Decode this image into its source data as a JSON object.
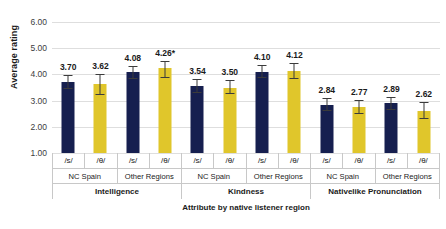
{
  "chart_data": {
    "type": "bar",
    "title": "",
    "xlabel": "Attribute by native listener region",
    "ylabel": "Average rating",
    "ylim": [
      1.0,
      6.0
    ],
    "ytick_labels": [
      "6.00",
      "5.00",
      "4.00",
      "3.00",
      "2.00",
      "1.00"
    ],
    "ytick_values": [
      6.0,
      5.0,
      4.0,
      3.0,
      2.0,
      1.0
    ],
    "grid": true,
    "legend_position": "none",
    "categories": [
      "Intelligence / NC Spain / /s/",
      "Intelligence / NC Spain / /θ/",
      "Intelligence / Other Regions / /s/",
      "Intelligence / Other Regions / /θ/",
      "Kindness / NC Spain / /s/",
      "Kindness / NC Spain / /θ/",
      "Kindness / Other Regions / /s/",
      "Kindness / Other Regions / /θ/",
      "Nativelike Pronunciation / NC Spain / /s/",
      "Nativelike Pronunciation / NC Spain / /θ/",
      "Nativelike Pronunciation / Other Regions / /s/",
      "Nativelike Pronunciation / Other Regions / /θ/"
    ],
    "values": [
      3.7,
      3.62,
      4.08,
      4.26,
      3.54,
      3.5,
      4.1,
      4.12,
      2.84,
      2.77,
      2.89,
      2.62
    ],
    "data_labels": [
      "3.70",
      "3.62",
      "4.08",
      "4.26*",
      "3.54",
      "3.50",
      "4.10",
      "4.12",
      "2.84",
      "2.77",
      "2.89",
      "2.62"
    ],
    "error_low": [
      3.46,
      3.21,
      3.84,
      3.86,
      3.28,
      3.24,
      3.86,
      3.83,
      2.6,
      2.5,
      2.63,
      2.3
    ],
    "error_high": [
      3.96,
      4.0,
      4.33,
      4.52,
      3.83,
      3.78,
      4.35,
      4.42,
      3.1,
      3.02,
      3.15,
      2.95
    ],
    "annotations": [
      "* indicates significant difference"
    ],
    "series_colors": {
      "s_phoneme": "#161f4f",
      "theta_phoneme": "#e0c62b"
    },
    "bars": [
      {
        "group": "Intelligence",
        "region": "NC Spain",
        "phoneme": "/s/",
        "value": 3.7,
        "label": "3.70",
        "low": 3.46,
        "high": 3.96,
        "color": "navy"
      },
      {
        "group": "Intelligence",
        "region": "NC Spain",
        "phoneme": "/θ/",
        "value": 3.62,
        "label": "3.62",
        "low": 3.21,
        "high": 4.0,
        "color": "gold"
      },
      {
        "group": "Intelligence",
        "region": "Other Regions",
        "phoneme": "/s/",
        "value": 4.08,
        "label": "4.08",
        "low": 3.84,
        "high": 4.33,
        "color": "navy"
      },
      {
        "group": "Intelligence",
        "region": "Other Regions",
        "phoneme": "/θ/",
        "value": 4.26,
        "label": "4.26*",
        "low": 3.86,
        "high": 4.52,
        "color": "gold"
      },
      {
        "group": "Kindness",
        "region": "NC Spain",
        "phoneme": "/s/",
        "value": 3.54,
        "label": "3.54",
        "low": 3.28,
        "high": 3.83,
        "color": "navy"
      },
      {
        "group": "Kindness",
        "region": "NC Spain",
        "phoneme": "/θ/",
        "value": 3.5,
        "label": "3.50",
        "low": 3.24,
        "high": 3.78,
        "color": "gold"
      },
      {
        "group": "Kindness",
        "region": "Other Regions",
        "phoneme": "/s/",
        "value": 4.1,
        "label": "4.10",
        "low": 3.86,
        "high": 4.35,
        "color": "navy"
      },
      {
        "group": "Kindness",
        "region": "Other Regions",
        "phoneme": "/θ/",
        "value": 4.12,
        "label": "4.12",
        "low": 3.83,
        "high": 4.42,
        "color": "gold"
      },
      {
        "group": "Nativelike Pronunciation",
        "region": "NC Spain",
        "phoneme": "/s/",
        "value": 2.84,
        "label": "2.84",
        "low": 2.6,
        "high": 3.1,
        "color": "navy"
      },
      {
        "group": "Nativelike Pronunciation",
        "region": "NC Spain",
        "phoneme": "/θ/",
        "value": 2.77,
        "label": "2.77",
        "low": 2.5,
        "high": 3.02,
        "color": "gold"
      },
      {
        "group": "Nativelike Pronunciation",
        "region": "Other Regions",
        "phoneme": "/s/",
        "value": 2.89,
        "label": "2.89",
        "low": 2.63,
        "high": 3.15,
        "color": "navy"
      },
      {
        "group": "Nativelike Pronunciation",
        "region": "Other Regions",
        "phoneme": "/θ/",
        "value": 2.62,
        "label": "2.62",
        "low": 2.3,
        "high": 2.95,
        "color": "gold"
      }
    ],
    "axis_rows": {
      "phonemes": [
        "/s/",
        "/θ/",
        "/s/",
        "/θ/",
        "/s/",
        "/θ/",
        "/s/",
        "/θ/",
        "/s/",
        "/θ/",
        "/s/",
        "/θ/"
      ],
      "regions": [
        "NC Spain",
        "Other Regions",
        "NC Spain",
        "Other Regions",
        "NC Spain",
        "Other Regions"
      ],
      "attributes": [
        "Intelligence",
        "Kindness",
        "Nativelike Pronunciation"
      ]
    }
  }
}
